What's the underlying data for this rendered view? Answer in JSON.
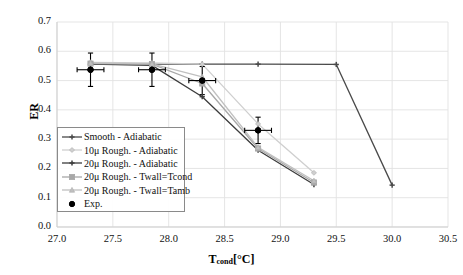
{
  "axes": {
    "ylabel": "ER",
    "xlabel_base": "T",
    "xlabel_sub": "cond",
    "xlabel_unit": "[°C]",
    "xlabel_full": "T_cond[°C]",
    "yticks": [
      "0.0",
      "0.1",
      "0.2",
      "0.3",
      "0.4",
      "0.5",
      "0.6",
      "0.7"
    ],
    "xticks": [
      "27.0",
      "27.5",
      "28.0",
      "28.5",
      "29.0",
      "29.5",
      "30.0",
      "30.5"
    ]
  },
  "legend": {
    "items": [
      {
        "label": "Smooth - Adiabatic",
        "marker": "cross-dark",
        "color": "#4a4a4a"
      },
      {
        "label": "10μ Rough. - Adiabatic",
        "marker": "diamond-light",
        "color": "#cfcfcf"
      },
      {
        "label": "20μ Rough. - Adiabatic",
        "marker": "cross-dark",
        "color": "#3c3c3c"
      },
      {
        "label": "20μ Rough. - Twall=Tcond",
        "marker": "square-gray",
        "color": "#a8a8a8"
      },
      {
        "label": "20μ Rough. - Twall=Tamb",
        "marker": "tri-light",
        "color": "#c0c0c0"
      },
      {
        "label": "Exp.",
        "marker": "dot-black",
        "color": "#000000"
      }
    ]
  },
  "chart_data": {
    "type": "line",
    "title": "",
    "xlabel": "T_cond[°C]",
    "ylabel": "ER",
    "xlim": [
      27.0,
      30.5
    ],
    "ylim": [
      0.0,
      0.7
    ],
    "xticks": [
      27.0,
      27.5,
      28.0,
      28.5,
      29.0,
      29.5,
      30.0,
      30.5
    ],
    "yticks": [
      0.0,
      0.1,
      0.2,
      0.3,
      0.4,
      0.5,
      0.6,
      0.7
    ],
    "grid": true,
    "legend_position": "lower-left-inside",
    "series": [
      {
        "name": "Smooth - Adiabatic",
        "color": "#4a4a4a",
        "marker": "cross",
        "x": [
          27.3,
          27.85,
          28.3,
          28.8,
          29.5,
          30.0
        ],
        "y": [
          0.557,
          0.556,
          0.556,
          0.556,
          0.555,
          0.143
        ]
      },
      {
        "name": "10μ Rough. - Adiabatic",
        "color": "#cfcfcf",
        "marker": "diamond",
        "x": [
          27.3,
          27.85,
          28.3,
          28.8,
          29.3
        ],
        "y": [
          0.562,
          0.56,
          0.556,
          0.352,
          0.185
        ]
      },
      {
        "name": "20μ Rough. - Adiabatic",
        "color": "#3c3c3c",
        "marker": "cross",
        "x": [
          27.3,
          27.85,
          28.3,
          28.8,
          29.3
        ],
        "y": [
          0.556,
          0.552,
          0.445,
          0.262,
          0.145
        ]
      },
      {
        "name": "20μ Rough. - Twall=Tcond",
        "color": "#a8a8a8",
        "marker": "square",
        "x": [
          27.3,
          27.85,
          28.3,
          28.8,
          29.3
        ],
        "y": [
          0.558,
          0.556,
          0.49,
          0.268,
          0.152
        ]
      },
      {
        "name": "20μ Rough. - Twall=Tamb",
        "color": "#c0c0c0",
        "marker": "triangle",
        "x": [
          27.3,
          27.85,
          28.3,
          28.8,
          29.3
        ],
        "y": [
          0.56,
          0.557,
          0.513,
          0.272,
          0.158
        ]
      },
      {
        "name": "Exp.",
        "color": "#000000",
        "marker": "dot",
        "style": "points-only",
        "x": [
          27.3,
          27.85,
          28.3,
          28.8
        ],
        "y": [
          0.537,
          0.537,
          0.5,
          0.33
        ],
        "xerr": [
          0.12,
          0.12,
          0.12,
          0.12
        ],
        "yerr": [
          0.057,
          0.057,
          0.048,
          0.045
        ]
      }
    ]
  }
}
